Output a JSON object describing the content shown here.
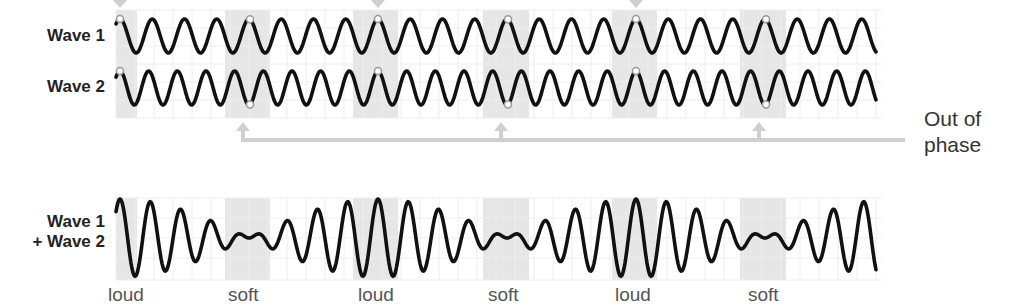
{
  "labels": {
    "wave1": "Wave 1",
    "wave2": "Wave 2",
    "sum_line1": "Wave 1",
    "sum_line2": "+ Wave 2",
    "out_of_phase_line1": "Out of",
    "out_of_phase_line2": "phase"
  },
  "beat_labels": [
    {
      "text": "loud",
      "x": 108
    },
    {
      "text": "soft",
      "x": 228
    },
    {
      "text": "loud",
      "x": 358
    },
    {
      "text": "soft",
      "x": 488
    },
    {
      "text": "loud",
      "x": 615
    },
    {
      "text": "soft",
      "x": 748
    }
  ],
  "colors": {
    "wave": "#111111",
    "band": "#e6e6e6",
    "grid": "#eeeeee",
    "arrow": "#cfcfcf",
    "marker_stroke": "#999999"
  },
  "chart_data": {
    "type": "line",
    "x_range": [
      116,
      876
    ],
    "beat_period_px": 258,
    "series": [
      {
        "name": "Wave 1",
        "cycles_per_beat": 8,
        "amplitude": 1.0,
        "in_phase_at": [
          120,
          378,
          636
        ],
        "out_of_phase_at": [
          250,
          508,
          766
        ]
      },
      {
        "name": "Wave 2",
        "cycles_per_beat": 9,
        "amplitude": 1.0,
        "in_phase_at": [
          120,
          378,
          636
        ],
        "out_of_phase_at": [
          250,
          508,
          766
        ]
      },
      {
        "name": "Wave 1 + Wave 2",
        "envelope": "beats",
        "loud_at": [
          120,
          378,
          636
        ],
        "soft_at": [
          250,
          508,
          766
        ]
      }
    ],
    "shaded_bands": [
      [
        116,
        137
      ],
      [
        225,
        270
      ],
      [
        353,
        398
      ],
      [
        483,
        529
      ],
      [
        612,
        657
      ],
      [
        740,
        786
      ]
    ],
    "annotations": [
      "In phase (top, cut off)",
      "Out of phase",
      "loud",
      "soft",
      "loud",
      "soft",
      "loud",
      "soft"
    ],
    "grid": true
  }
}
